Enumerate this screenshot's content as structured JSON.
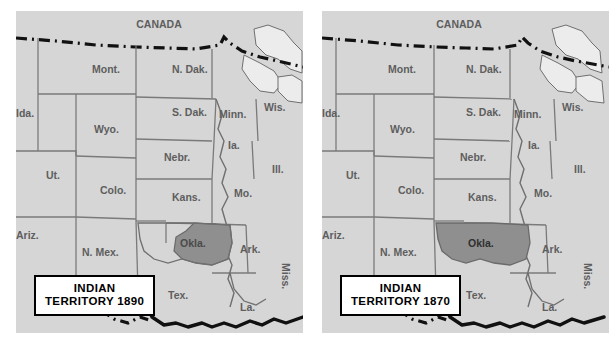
{
  "figure": {
    "type": "historical-map-pair",
    "background_color": "#ffffff"
  },
  "style": {
    "land_fill": "#d6d6d6",
    "highlight_fill": "#8f8f8f",
    "lake_fill": "#ececec",
    "state_border_color": "#7a7a7a",
    "coast_border_color": "#111111",
    "label_color": "#5e5e5e",
    "caption_text_color": "#000000",
    "caption_fill": "#ffffff"
  },
  "panels": [
    {
      "id": "map-1890",
      "caption": {
        "line1": "INDIAN",
        "line2": "TERRITORY 1890"
      },
      "highlight": {
        "region": "Okla.",
        "extent": "eastern-portion",
        "note": "Only the eastern half of Oklahoma is shaded"
      },
      "country_label": "CANADA",
      "state_labels": [
        {
          "name": "Mont.",
          "x": 76,
          "y": 62,
          "rotate": 0
        },
        {
          "name": "N. Dak.",
          "x": 156,
          "y": 62,
          "rotate": 0
        },
        {
          "name": "Ida.",
          "x": 16,
          "y": 106,
          "rotate": 0
        },
        {
          "name": "S. Dak.",
          "x": 156,
          "y": 105,
          "rotate": 0
        },
        {
          "name": "Minn.",
          "x": 212,
          "y": 107,
          "rotate": 0
        },
        {
          "name": "Wis.",
          "x": 256,
          "y": 100,
          "rotate": 0
        },
        {
          "name": "Wyo.",
          "x": 84,
          "y": 120,
          "rotate": 0
        },
        {
          "name": "Nebr.",
          "x": 156,
          "y": 148,
          "rotate": 0
        },
        {
          "name": "Ia.",
          "x": 215,
          "y": 136,
          "rotate": 0
        },
        {
          "name": "Ut.",
          "x": 36,
          "y": 165,
          "rotate": 0
        },
        {
          "name": "Ill.",
          "x": 258,
          "y": 160,
          "rotate": 0
        },
        {
          "name": "Colo.",
          "x": 94,
          "y": 180,
          "rotate": 0
        },
        {
          "name": "Kans.",
          "x": 166,
          "y": 187,
          "rotate": 0
        },
        {
          "name": "Mo.",
          "x": 222,
          "y": 183,
          "rotate": 0
        },
        {
          "name": "Ariz.",
          "x": 14,
          "y": 224,
          "rotate": 0
        },
        {
          "name": "N. Mex.",
          "x": 78,
          "y": 242,
          "rotate": 0
        },
        {
          "name": "Okla.",
          "x": 178,
          "y": 232,
          "rotate": 0
        },
        {
          "name": "Ark.",
          "x": 230,
          "y": 238,
          "rotate": 0
        },
        {
          "name": "Miss.",
          "x": 268,
          "y": 268,
          "rotate": 90
        },
        {
          "name": "Tex.",
          "x": 160,
          "y": 285,
          "rotate": 0
        },
        {
          "name": "La.",
          "x": 228,
          "y": 296,
          "rotate": 0
        }
      ]
    },
    {
      "id": "map-1870",
      "caption": {
        "line1": "INDIAN",
        "line2": "TERRITORY 1870"
      },
      "highlight": {
        "region": "Okla.",
        "extent": "full-territory",
        "note": "The entire Oklahoma territory is shaded"
      },
      "country_label": "CANADA",
      "state_labels": [
        {
          "name": "Mont.",
          "x": 70,
          "y": 62,
          "rotate": 0
        },
        {
          "name": "N. Dak.",
          "x": 144,
          "y": 62,
          "rotate": 0
        },
        {
          "name": "Ida.",
          "x": 14,
          "y": 106,
          "rotate": 0
        },
        {
          "name": "S. Dak.",
          "x": 144,
          "y": 105,
          "rotate": 0
        },
        {
          "name": "Minn.",
          "x": 200,
          "y": 107,
          "rotate": 0
        },
        {
          "name": "Wis.",
          "x": 248,
          "y": 100,
          "rotate": 0
        },
        {
          "name": "Wyo.",
          "x": 76,
          "y": 120,
          "rotate": 0
        },
        {
          "name": "Nebr.",
          "x": 146,
          "y": 148,
          "rotate": 0
        },
        {
          "name": "Ia.",
          "x": 208,
          "y": 136,
          "rotate": 0
        },
        {
          "name": "Ut.",
          "x": 30,
          "y": 165,
          "rotate": 0
        },
        {
          "name": "Ill.",
          "x": 256,
          "y": 160,
          "rotate": 0
        },
        {
          "name": "Colo.",
          "x": 86,
          "y": 180,
          "rotate": 0
        },
        {
          "name": "Kans.",
          "x": 156,
          "y": 187,
          "rotate": 0
        },
        {
          "name": "Mo.",
          "x": 216,
          "y": 183,
          "rotate": 0
        },
        {
          "name": "Ariz.",
          "x": 12,
          "y": 224,
          "rotate": 0
        },
        {
          "name": "N. Mex.",
          "x": 70,
          "y": 242,
          "rotate": 0
        },
        {
          "name": "Okla.",
          "x": 166,
          "y": 232,
          "rotate": 0
        },
        {
          "name": "Ark.",
          "x": 226,
          "y": 238,
          "rotate": 0
        },
        {
          "name": "Miss.",
          "x": 264,
          "y": 268,
          "rotate": 90
        },
        {
          "name": "Tex.",
          "x": 152,
          "y": 285,
          "rotate": 0
        },
        {
          "name": "La.",
          "x": 226,
          "y": 296,
          "rotate": 0
        }
      ]
    }
  ]
}
